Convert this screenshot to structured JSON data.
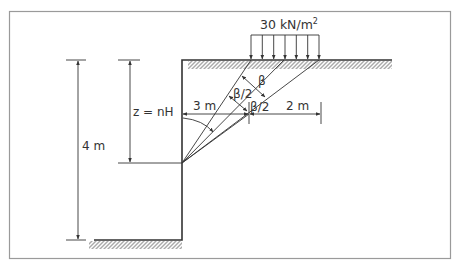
{
  "diagram": {
    "load_label": "30 kN/m",
    "load_superscript": "2",
    "height_label": "4 m",
    "depth_label": "z = nH",
    "horizontal_left_label": "3 m",
    "horizontal_right_label": "2 m",
    "angle_beta_label": "β",
    "angle_half_beta_left_label": "β/2",
    "angle_half_beta_right_label": "β/2",
    "load_arrow_count": 7,
    "colors": {
      "line": "#333333",
      "frame": "#9a9a9a",
      "background": "#ffffff"
    }
  }
}
